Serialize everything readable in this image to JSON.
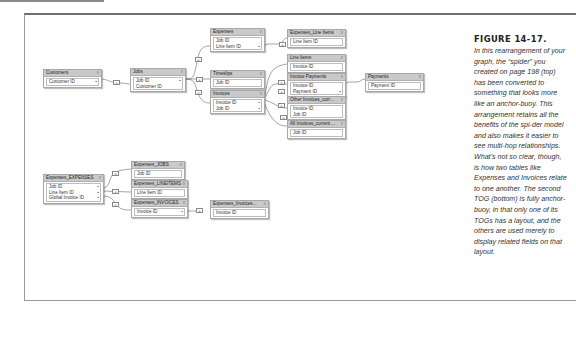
{
  "caption": {
    "figure_label": "FIGURE 14-17.",
    "text": "In this rearrangement of your graph, the “spider” you created on page 198 (top) has been converted to something that looks more like an anchor-buoy. This arrangement retains all the benefits of the spi-der model and also makes it easier to see multi-hop relationships. What’s not so clear, though, is how two tables like Expenses and Invoices relate to one another. The second TOG (bottom) is fully anchor-buoy, in that only one of its TOGs has a layout, and the others are used merely to display related fields on that layout."
  },
  "menu_icon": "≡",
  "relationship_symbol": "=",
  "tog_top": {
    "tables": [
      {
        "id": "customers",
        "name": "Customers",
        "fields": [
          "Customer ID"
        ]
      },
      {
        "id": "jobs",
        "name": "Jobs",
        "fields": [
          "Job ID",
          "Customer ID"
        ]
      },
      {
        "id": "expenses",
        "name": "Expenses",
        "fields": [
          "Job ID",
          "Line Item ID"
        ]
      },
      {
        "id": "timeslips",
        "name": "Timeslips",
        "fields": [
          "Job ID"
        ]
      },
      {
        "id": "invoices",
        "name": "Invoices",
        "fields": [
          "Invoice ID",
          "Job ID"
        ]
      },
      {
        "id": "expenses_line_items",
        "name": "Expenses_Line Items",
        "fields": [
          "Line Item ID"
        ]
      },
      {
        "id": "line_items",
        "name": "Line Items",
        "fields": [
          "Invoice ID"
        ]
      },
      {
        "id": "invoice_payments",
        "name": "Invoice Payments",
        "fields": [
          "Invoice ID",
          "Payment ID"
        ]
      },
      {
        "id": "payments",
        "name": "Payments",
        "fields": [
          "Payment ID"
        ]
      },
      {
        "id": "other_invoices_current",
        "name": "Other Invoices_curr...",
        "fields": [
          "Invoice ID",
          "Job ID"
        ]
      },
      {
        "id": "all_invoices_current",
        "name": "All Invoices_current ...",
        "fields": [
          "Job ID"
        ]
      }
    ]
  },
  "tog_bottom": {
    "tables": [
      {
        "id": "expenses_expenses",
        "name": "Expenses_EXPENSES",
        "fields": [
          "Job ID",
          "Line Item ID",
          "Global Invoice ID"
        ]
      },
      {
        "id": "expenses_jobs",
        "name": "Expenses_JOBS",
        "fields": [
          "Job ID"
        ]
      },
      {
        "id": "expenses_lineitems",
        "name": "Expenses_LINEITEMS",
        "fields": [
          "Line Item ID"
        ]
      },
      {
        "id": "expenses_invoices",
        "name": "Expenses_INVOICES",
        "fields": [
          "Invoice ID"
        ]
      },
      {
        "id": "expenses_invoices_2",
        "name": "Expenses_Invoices...",
        "fields": [
          "Invoice ID"
        ]
      }
    ]
  }
}
